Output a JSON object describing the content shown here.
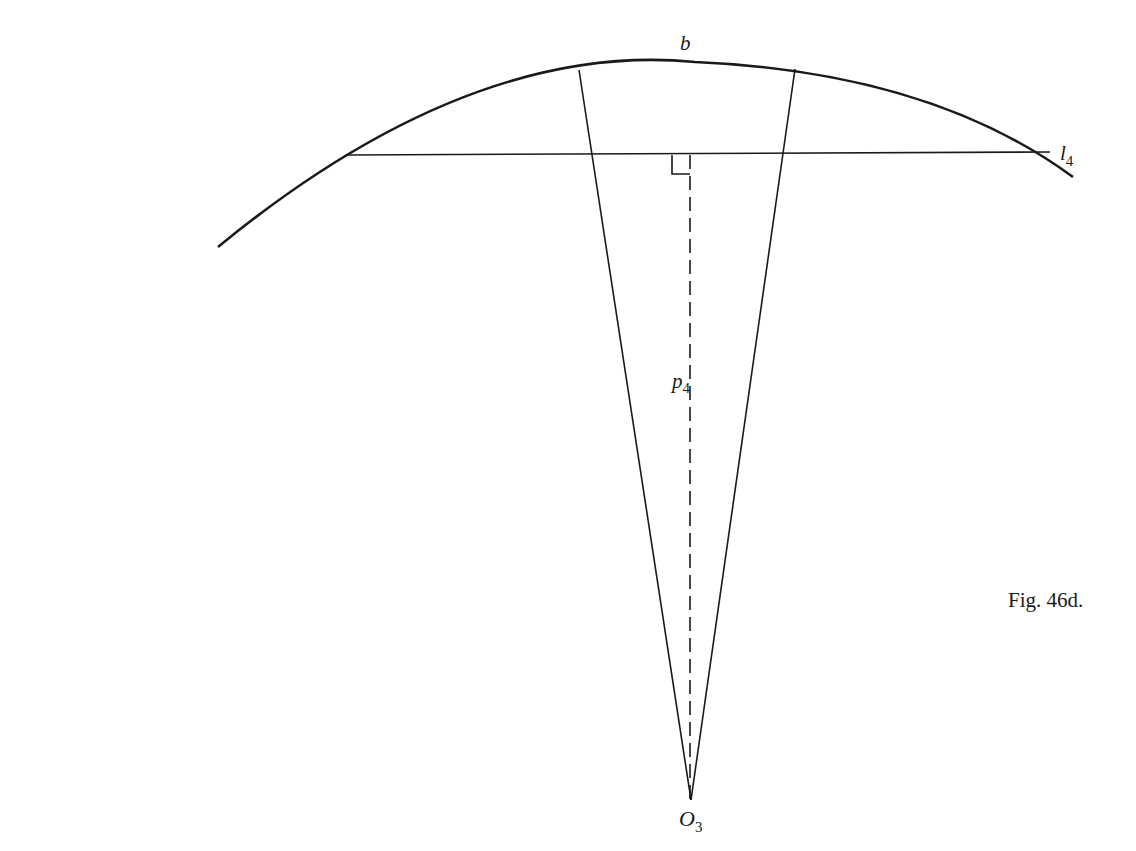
{
  "figure": {
    "caption": "Fig. 46d.",
    "labels": {
      "arc": "b",
      "line_main": "l",
      "line_sub": "4",
      "perp_main": "p",
      "perp_sub": "4",
      "center_main": "O",
      "center_sub": "3"
    },
    "colors": {
      "stroke": "#1a1a1a",
      "background": "#ffffff"
    }
  }
}
